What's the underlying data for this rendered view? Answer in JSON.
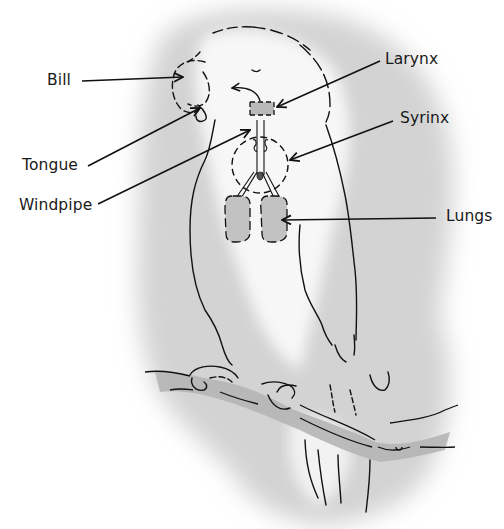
{
  "diagram": {
    "colors": {
      "wash": "#cfcfcf",
      "wash_light": "#e4e4e4",
      "organ_fill": "#b9b9b9",
      "ink": "#111111"
    },
    "labels": [
      {
        "id": "bill",
        "text": "Bill",
        "x": 47,
        "y": 73
      },
      {
        "id": "larynx",
        "text": "Larynx",
        "x": 385,
        "y": 52
      },
      {
        "id": "syrinx",
        "text": "Syrinx",
        "x": 400,
        "y": 111
      },
      {
        "id": "tongue",
        "text": "Tongue",
        "x": 22,
        "y": 158
      },
      {
        "id": "windpipe",
        "text": "Windpipe",
        "x": 19,
        "y": 198
      },
      {
        "id": "lungs",
        "text": "Lungs",
        "x": 446,
        "y": 209
      }
    ],
    "parts": [
      "head",
      "bill",
      "tongue",
      "larynx",
      "windpipe",
      "syrinx",
      "lungs",
      "body",
      "feet",
      "perch",
      "tail"
    ]
  }
}
